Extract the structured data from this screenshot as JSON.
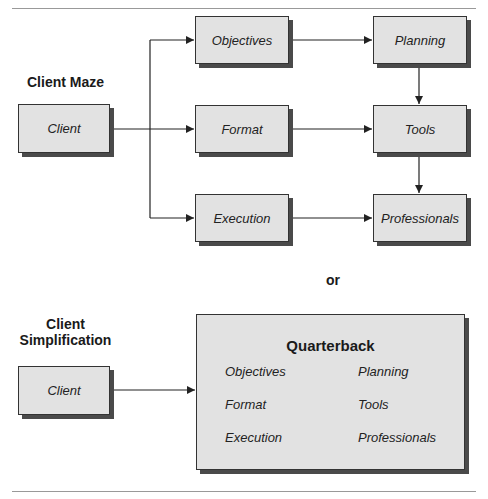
{
  "maze": {
    "title": "Client Maze",
    "client": "Client",
    "middle": [
      "Objectives",
      "Format",
      "Execution"
    ],
    "right": [
      "Planning",
      "Tools",
      "Professionals"
    ]
  },
  "or": "or",
  "simple": {
    "title_line1": "Client",
    "title_line2": "Simplification",
    "client": "Client",
    "quarterback": "Quarterback",
    "left": [
      "Objectives",
      "Format",
      "Execution"
    ],
    "right": [
      "Planning",
      "Tools",
      "Professionals"
    ]
  }
}
